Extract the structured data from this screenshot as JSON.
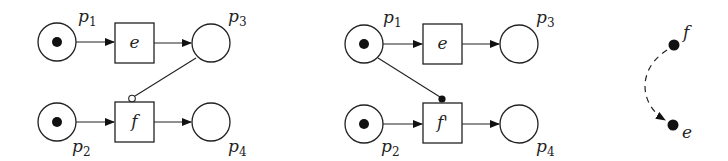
{
  "net1": {
    "places": {
      "p1": {
        "label": "p",
        "sub": "1",
        "tokens": 1
      },
      "p2": {
        "label": "p",
        "sub": "2",
        "tokens": 1
      },
      "p3": {
        "label": "p",
        "sub": "3",
        "tokens": 0
      },
      "p4": {
        "label": "p",
        "sub": "4",
        "tokens": 0
      }
    },
    "transitions": {
      "e": {
        "label": "e"
      },
      "f": {
        "label": "f"
      }
    },
    "special_arc": {
      "from": "p3",
      "to": "f",
      "type": "inhibitor (open circle)"
    }
  },
  "net2": {
    "places": {
      "p1": {
        "label": "p",
        "sub": "1",
        "tokens": 1
      },
      "p2": {
        "label": "p",
        "sub": "2",
        "tokens": 1
      },
      "p3": {
        "label": "p",
        "sub": "3",
        "tokens": 0
      },
      "p4": {
        "label": "p",
        "sub": "4",
        "tokens": 0
      }
    },
    "transitions": {
      "e": {
        "label": "e"
      },
      "f": {
        "label": "f'"
      }
    },
    "special_arc": {
      "from": "p1",
      "to": "f'",
      "type": "read arc (filled dot)"
    }
  },
  "graph": {
    "nodes": {
      "f": {
        "label": "f"
      },
      "e": {
        "label": "e"
      }
    },
    "edge": {
      "from": "f",
      "to": "e",
      "style": "dashed curved arrow"
    }
  }
}
